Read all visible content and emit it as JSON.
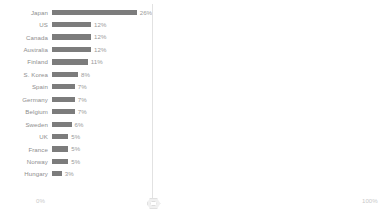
{
  "chart_data": {
    "type": "bar",
    "orientation": "horizontal",
    "title": "",
    "xlabel": "",
    "ylabel": "",
    "xlim": [
      0,
      100
    ],
    "grid": false,
    "legend": null,
    "unit": "%",
    "categories": [
      "Japan",
      "US",
      "Canada",
      "Australia",
      "Finland",
      "S. Korea",
      "Spain",
      "Germany",
      "Belgium",
      "Sweden",
      "UK",
      "France",
      "Norway",
      "Hungary"
    ],
    "values": [
      26,
      12,
      12,
      12,
      11,
      8,
      7,
      7,
      7,
      6,
      5,
      5,
      5,
      3
    ],
    "value_labels": [
      "26%",
      "12%",
      "12%",
      "12%",
      "11%",
      "8%",
      "7%",
      "7%",
      "7%",
      "6%",
      "5%",
      "5%",
      "5%",
      "3%"
    ],
    "bar_color": "#7c7c7c",
    "axis_ticks": [
      "0%",
      "100%"
    ],
    "marker_position_pct": 40
  },
  "axis": {
    "min_label": "0%",
    "max_label": "100%"
  },
  "marker": {
    "name": "axis-handle"
  }
}
